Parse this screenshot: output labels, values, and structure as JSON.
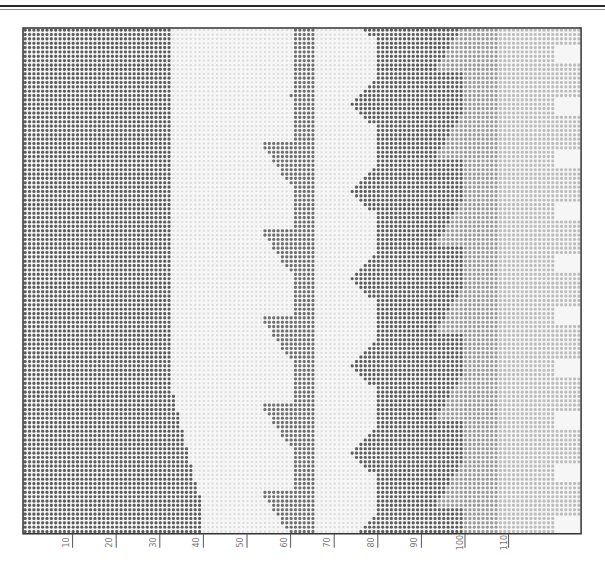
{
  "chart_data": {
    "type": "heatmap",
    "title": "",
    "grid": {
      "columns": 128,
      "rows": 116,
      "x0": 23,
      "y0": 28,
      "cell_w": 4.36,
      "cell_h": 4.36
    },
    "x_ticks": [
      10,
      20,
      30,
      40,
      50,
      60,
      70,
      80,
      90,
      100,
      110
    ],
    "x_tick_labels": [
      "10",
      "20",
      "30",
      "40",
      "50",
      "60",
      "70",
      "80",
      "90",
      "100",
      "110"
    ],
    "tones": {
      "dark": "#5c5c5c",
      "mid_dark": "#6e6e6e",
      "mid": "#9a9a9a",
      "light": "#bdbdbd",
      "very_light": "#dcdcdc",
      "blank": "#f2f2f2"
    },
    "bands": [
      {
        "name": "left-dark",
        "tone": "dark",
        "col_start": 0,
        "col_end": 33
      },
      {
        "name": "pale-field",
        "tone": "very_light",
        "col_start": 34,
        "col_end": 61
      },
      {
        "name": "center-strip",
        "tone": "mid_dark",
        "col_start": 62,
        "col_end": 66
      },
      {
        "name": "center-gap",
        "tone": "very_light",
        "col_start": 67,
        "col_end": 80
      },
      {
        "name": "right-dark",
        "tone": "dark",
        "col_start": 81,
        "col_end": 100
      },
      {
        "name": "grey-band",
        "tone": "mid",
        "col_start": 101,
        "col_end": 108
      },
      {
        "name": "light-band",
        "tone": "light",
        "col_start": 109,
        "col_end": 127
      }
    ]
  },
  "axis": {
    "labels": [
      "10",
      "20",
      "30",
      "40",
      "50",
      "60",
      "70",
      "80",
      "90",
      "100",
      "110"
    ]
  }
}
